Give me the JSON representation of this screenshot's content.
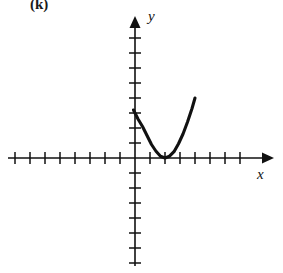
{
  "figure": {
    "part_label": "(k)",
    "background_color": "#ffffff",
    "ink_color": "#111111"
  },
  "axes": {
    "x_label": "x",
    "y_label": "y",
    "x_arrow_icon": "arrow-right-icon",
    "y_arrow_icon": "arrow-up-icon",
    "origin_px": {
      "x": 135,
      "y": 158
    },
    "tick_spacing_px": 15,
    "tick_half_length_px": 5,
    "x_ticks_left_of_origin": 8,
    "x_ticks_right_of_origin": 7,
    "y_ticks_above_origin": 8,
    "y_ticks_below_origin": 7,
    "axis_line_width_px": 1.6,
    "grid": false,
    "tick_labels_shown": false
  },
  "chart_data": {
    "type": "line",
    "title": "(k)",
    "xlabel": "x",
    "ylabel": "y",
    "xlim": [
      -8,
      7
    ],
    "ylim": [
      -7,
      8
    ],
    "grid": false,
    "legend": "none",
    "curve_name": "parabola",
    "equation": "y = (x - 2)^2",
    "vertex": [
      2,
      0
    ],
    "y_intercept": [
      0,
      3.2
    ],
    "domain_drawn": [
      -0.1,
      4.0
    ],
    "series": [
      {
        "name": "y = (x - 2)^2",
        "x": [
          -0.1,
          0.2,
          0.5,
          0.8,
          1.1,
          1.4,
          1.7,
          2.0,
          2.3,
          2.6,
          2.9,
          3.2,
          3.5,
          3.8,
          4.0
        ],
        "y": [
          3.2,
          2.6,
          2.1,
          1.5,
          0.9,
          0.45,
          0.12,
          0.0,
          0.12,
          0.42,
          0.95,
          1.6,
          2.4,
          3.3,
          4.0
        ]
      }
    ]
  }
}
